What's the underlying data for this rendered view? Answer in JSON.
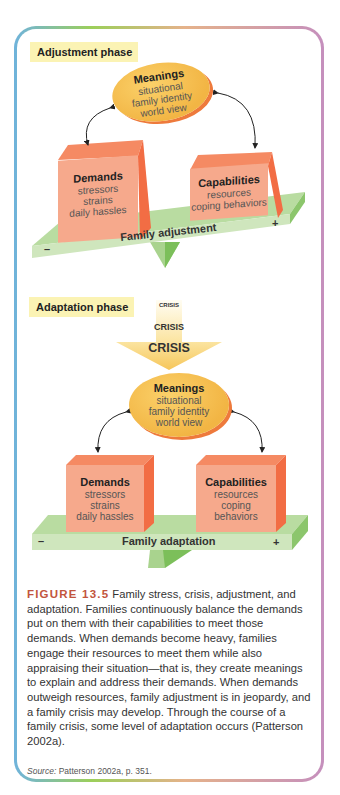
{
  "figure": {
    "adjustment_phase": {
      "label": "Adjustment phase",
      "meanings": {
        "title": "Meanings",
        "items": [
          "situational",
          "family identity",
          "world view"
        ]
      },
      "demands": {
        "title": "Demands",
        "items": [
          "stressors",
          "strains",
          "daily hassles"
        ]
      },
      "capabilities": {
        "title": "Capabilities",
        "items": [
          "resources",
          "coping behaviors"
        ]
      },
      "plank_label": "Family adjustment",
      "minus": "–",
      "plus": "+"
    },
    "adaptation_phase": {
      "label": "Adaptation phase",
      "crisis": [
        "CRISIS",
        "CRISIS",
        "CRISIS"
      ],
      "meanings": {
        "title": "Meanings",
        "items": [
          "situational",
          "family identity",
          "world view"
        ]
      },
      "demands": {
        "title": "Demands",
        "items": [
          "stressors",
          "strains",
          "daily hassles"
        ]
      },
      "capabilities": {
        "title": "Capabilities",
        "items": [
          "resources",
          "coping",
          "behaviors"
        ]
      },
      "plank_label": "Family adaptation",
      "minus": "–",
      "plus": "+"
    },
    "caption": {
      "label": "FIGURE 13.5",
      "text": "Family stress, crisis, adjustment, and adaptation. Families continuously balance the demands put on them with their capabilities to meet those demands. When demands become heavy, families engage their resources to meet them while also appraising their situation—that is, they create meanings to explain and address their demands. When demands outweigh resources, family adjustment is in jeopardy, and a family crisis may develop. Through the course of a family crisis, some level of adaptation occurs (Patterson 2002a)."
    },
    "source": {
      "label": "Source:",
      "text": " Patterson 2002a, p. 351."
    },
    "colors": {
      "ellipse": "#f2b544",
      "box_front": "#f6a98c",
      "box_side": "#f26d44",
      "plank": "#b9dca1",
      "label_bg": "#fbf3b4",
      "figure_label": "#c2553d"
    }
  }
}
